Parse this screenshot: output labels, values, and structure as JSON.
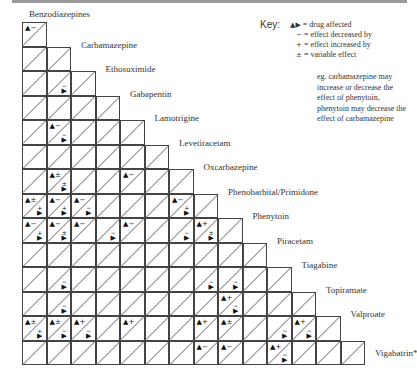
{
  "key": {
    "title": "Key:",
    "entries": [
      {
        "symbol": "▲▶",
        "text": "= drug affected"
      },
      {
        "symbol": "−",
        "text": "= effect decreased by"
      },
      {
        "symbol": "+",
        "text": "= effect increased by"
      },
      {
        "symbol": "±",
        "text": "= variable effect"
      }
    ],
    "example": "eg. carbamazepine may increase or decrease the effect of phenytoin, phenytoin may decrease the effect of carbamazepine"
  },
  "grid": {
    "left": 22,
    "top": 22,
    "cell": 24.5,
    "drugs": [
      "Benzodiazepines",
      "Carbamazepine",
      "Ethosuximide",
      "Gabapentin",
      "Lamotrigine",
      "Levetiracetam",
      "Oxcarbazepine",
      "Phenobarbital/Primidone",
      "Phenytoin",
      "Piracetam",
      "Tiagabine",
      "Topiramate",
      "Valproate",
      "Vigabatrin*"
    ],
    "interactions": [
      {
        "row": 0,
        "col": 0,
        "a": "−"
      },
      {
        "row": 2,
        "col": 1,
        "b": "−"
      },
      {
        "row": 4,
        "col": 1,
        "a": "−",
        "b": "−"
      },
      {
        "row": 6,
        "col": 1,
        "a": "±",
        "b": "±"
      },
      {
        "row": 6,
        "col": 4,
        "a": "−"
      },
      {
        "row": 7,
        "col": 0,
        "a": "±",
        "b": "+"
      },
      {
        "row": 7,
        "col": 1,
        "a": "−",
        "b": "+"
      },
      {
        "row": 7,
        "col": 2,
        "a": "−",
        "b": "−"
      },
      {
        "row": 7,
        "col": 6,
        "a": "−",
        "b": "+"
      },
      {
        "row": 8,
        "col": 0,
        "a": "−",
        "b": "+"
      },
      {
        "row": 8,
        "col": 1,
        "a": "−",
        "b": "±"
      },
      {
        "row": 8,
        "col": 2,
        "a": "−"
      },
      {
        "row": 8,
        "col": 3,
        "b": "−"
      },
      {
        "row": 8,
        "col": 4,
        "a": "−"
      },
      {
        "row": 8,
        "col": 6,
        "b": "−"
      },
      {
        "row": 8,
        "col": 7,
        "a": "+",
        "b": "±"
      },
      {
        "row": 10,
        "col": 1,
        "b": "−"
      },
      {
        "row": 10,
        "col": 7,
        "b": "−"
      },
      {
        "row": 10,
        "col": 8,
        "b": "−"
      },
      {
        "row": 11,
        "col": 1,
        "b": "−"
      },
      {
        "row": 11,
        "col": 8,
        "a": "+",
        "b": "−"
      },
      {
        "row": 12,
        "col": 0,
        "a": "±",
        "b": "+"
      },
      {
        "row": 12,
        "col": 1,
        "a": "±",
        "b": "−"
      },
      {
        "row": 12,
        "col": 2,
        "a": "+",
        "b": "−"
      },
      {
        "row": 12,
        "col": 4,
        "a": "+"
      },
      {
        "row": 12,
        "col": 7,
        "a": "+"
      },
      {
        "row": 12,
        "col": 8,
        "a": "±"
      },
      {
        "row": 12,
        "col": 10,
        "b": "−"
      },
      {
        "row": 12,
        "col": 11,
        "a": "+",
        "b": "−"
      },
      {
        "row": 13,
        "col": 7,
        "a": "−"
      },
      {
        "row": 13,
        "col": 8,
        "a": "−"
      },
      {
        "row": 13,
        "col": 10,
        "a": "+",
        "b": "−"
      }
    ]
  }
}
